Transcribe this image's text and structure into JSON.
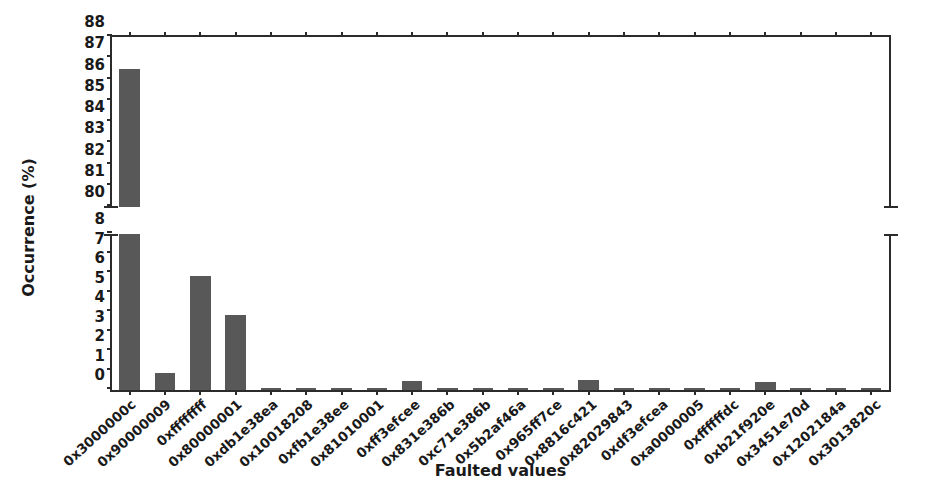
{
  "chart_data": {
    "type": "bar",
    "title": "",
    "xlabel": "Faulted values",
    "ylabel": "Occurrence (%)",
    "broken_axis": true,
    "grid": false,
    "legend": null,
    "bar_color": "#585858",
    "axis_color": "#2b2b2b",
    "upper_panel": {
      "ylim": [
        80,
        88
      ],
      "yticks": [
        80,
        81,
        82,
        83,
        84,
        85,
        86,
        87,
        88
      ]
    },
    "lower_panel": {
      "ylim": [
        0,
        8
      ],
      "yticks": [
        0,
        1,
        2,
        3,
        4,
        5,
        6,
        7,
        8
      ]
    },
    "categories": [
      "0x3000000c",
      "0x90000009",
      "0xffffffff",
      "0x80000001",
      "0xdb1e38ea",
      "0x10018208",
      "0xfb1e38ee",
      "0x81010001",
      "0xff3efcee",
      "0x831e386b",
      "0xc71e386b",
      "0x5b2af46a",
      "0x965ff7ce",
      "0x8816c421",
      "0x82029843",
      "0xdf3efcea",
      "0xa0000005",
      "0xffffffdc",
      "0xb21f920e",
      "0x3451e70d",
      "0x1202184a",
      "0x3013820c"
    ],
    "values": [
      86.5,
      0.85,
      5.85,
      3.85,
      0.12,
      0.12,
      0.12,
      0.12,
      0.45,
      0.12,
      0.12,
      0.12,
      0.12,
      0.5,
      0.12,
      0.12,
      0.12,
      0.12,
      0.4,
      0.12,
      0.12,
      0.12
    ]
  }
}
